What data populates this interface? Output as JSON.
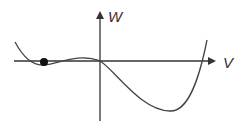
{
  "diagram": {
    "type": "potential-curve",
    "axes": {
      "vertical": {
        "label": "W"
      },
      "horizontal": {
        "label": "V"
      }
    },
    "colors": {
      "axis": "#333333",
      "curve": "#444444",
      "point": "#111111",
      "background": "#ffffff"
    },
    "features": {
      "marked_point": "ball at local minimum left of origin",
      "local_maximum": "small hump just left of origin",
      "global_minimum": "deep well right of origin"
    }
  }
}
